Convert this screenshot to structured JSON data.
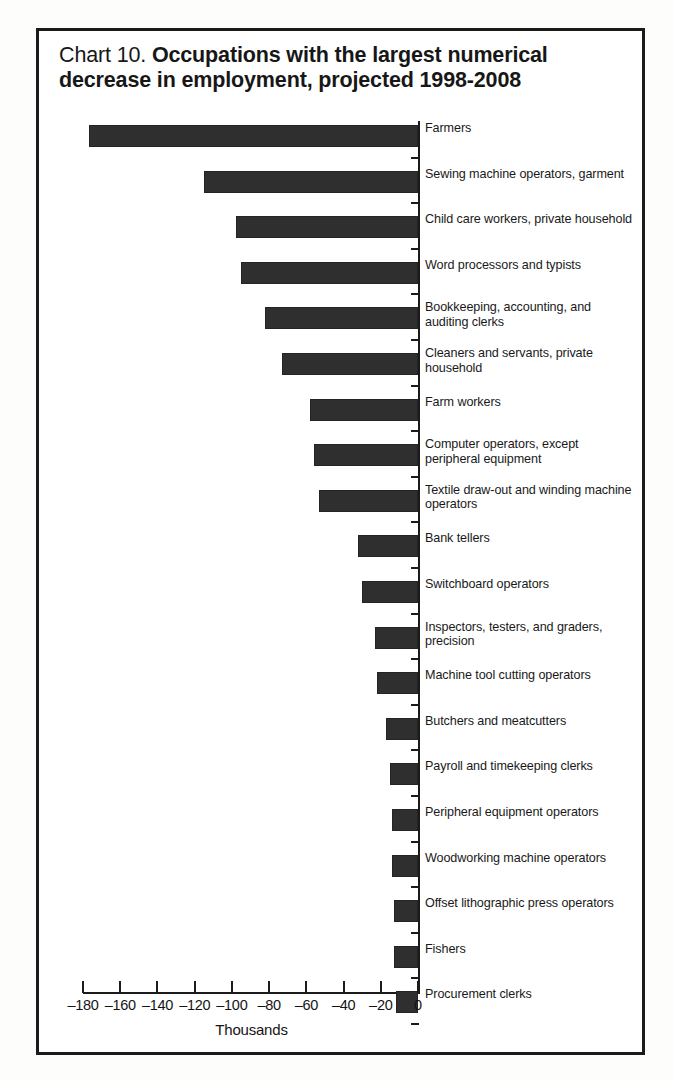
{
  "title": {
    "prefix": "Chart 10.",
    "line1_bold": "Occupations with the largest numerical",
    "line2_bold": "decrease in employment, projected 1998-2008"
  },
  "axis": {
    "x_title": "Thousands",
    "x_ticks": [
      "-180",
      "-160",
      "-140",
      "-120",
      "-100",
      "-80",
      "-60",
      "-40",
      "-20",
      "0"
    ]
  },
  "chart_data": {
    "type": "bar",
    "orientation": "horizontal",
    "title": "Chart 10. Occupations with the largest numerical decrease in employment, projected 1998-2008",
    "xlabel": "Thousands",
    "ylabel": "",
    "xlim": [
      -180,
      0
    ],
    "xtick_step": 20,
    "grid": false,
    "legend": null,
    "bar_color": "#2f2f2f",
    "categories": [
      "Farmers",
      "Sewing machine operators, garment",
      "Child care workers, private household",
      "Word processors and typists",
      "Bookkeeping, accounting, and auditing clerks",
      "Cleaners and servants, private household",
      "Farm workers",
      "Computer operators, except peripheral equipment",
      "Textile draw-out and winding machine operators",
      "Bank tellers",
      "Switchboard operators",
      "Inspectors, testers, and graders, precision",
      "Machine tool cutting operators",
      "Butchers and meatcutters",
      "Payroll and timekeeping clerks",
      "Peripheral equipment operators",
      "Woodworking machine operators",
      "Offset lithographic press operators",
      "Fishers",
      "Procurement clerks"
    ],
    "values": [
      -177,
      -115,
      -98,
      -95,
      -82,
      -73,
      -58,
      -56,
      -53,
      -32,
      -30,
      -23,
      -22,
      -17,
      -15,
      -14,
      -14,
      -13,
      -13,
      -12
    ]
  },
  "bars": [
    {
      "label_lines": [
        "Farmers"
      ],
      "value": -177
    },
    {
      "label_lines": [
        "Sewing machine operators, garment"
      ],
      "value": -115
    },
    {
      "label_lines": [
        "Child care workers, private household"
      ],
      "value": -98
    },
    {
      "label_lines": [
        "Word processors and typists"
      ],
      "value": -95
    },
    {
      "label_lines": [
        "Bookkeeping, accounting, and",
        "auditing clerks"
      ],
      "value": -82
    },
    {
      "label_lines": [
        "Cleaners and servants, private",
        "household"
      ],
      "value": -73
    },
    {
      "label_lines": [
        "Farm workers"
      ],
      "value": -58
    },
    {
      "label_lines": [
        "Computer operators, except",
        "peripheral equipment"
      ],
      "value": -56
    },
    {
      "label_lines": [
        "Textile draw-out and winding machine",
        "operators"
      ],
      "value": -53
    },
    {
      "label_lines": [
        "Bank tellers"
      ],
      "value": -32
    },
    {
      "label_lines": [
        "Switchboard operators"
      ],
      "value": -30
    },
    {
      "label_lines": [
        "Inspectors, testers, and graders,",
        "precision"
      ],
      "value": -23
    },
    {
      "label_lines": [
        "Machine tool cutting operators"
      ],
      "value": -22
    },
    {
      "label_lines": [
        "Butchers and meatcutters"
      ],
      "value": -17
    },
    {
      "label_lines": [
        "Payroll and timekeeping clerks"
      ],
      "value": -15
    },
    {
      "label_lines": [
        "Peripheral equipment operators"
      ],
      "value": -14
    },
    {
      "label_lines": [
        "Woodworking machine operators"
      ],
      "value": -14
    },
    {
      "label_lines": [
        "Offset lithographic press operators"
      ],
      "value": -13
    },
    {
      "label_lines": [
        "Fishers"
      ],
      "value": -13
    },
    {
      "label_lines": [
        "Procurement clerks"
      ],
      "value": -12
    }
  ]
}
